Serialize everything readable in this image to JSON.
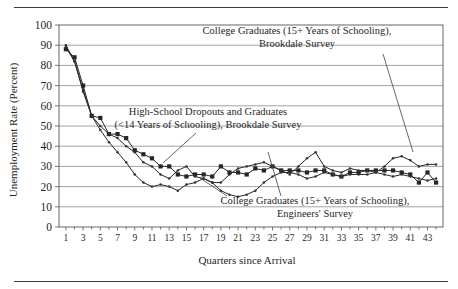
{
  "figure": {
    "top_rule": "rule",
    "bottom_rule": "rule"
  },
  "chart_data": {
    "type": "line",
    "title": "",
    "xlabel": "Quarters since Arrival",
    "ylabel": "Unemployment Rate (Percent)",
    "xlim": [
      0.2,
      44.8
    ],
    "ylim": [
      0,
      100
    ],
    "ytick_values": [
      0,
      10,
      20,
      30,
      40,
      50,
      60,
      70,
      80,
      90,
      100
    ],
    "ytick_labels": [
      "0",
      "10",
      "20",
      "30",
      "40",
      "50",
      "60",
      "70",
      "80",
      "90",
      "100"
    ],
    "xtick_values": [
      1,
      3,
      5,
      7,
      9,
      11,
      13,
      15,
      17,
      19,
      21,
      23,
      25,
      27,
      29,
      31,
      33,
      35,
      37,
      39,
      41,
      43
    ],
    "xtick_labels": [
      "1",
      "3",
      "5",
      "7",
      "9",
      "11",
      "13",
      "15",
      "17",
      "19",
      "21",
      "23",
      "25",
      "27",
      "29",
      "31",
      "33",
      "35",
      "37",
      "39",
      "41",
      "43"
    ],
    "xtick_minor_values": [
      2,
      4,
      6,
      8,
      10,
      12,
      14,
      16,
      18,
      20,
      22,
      24,
      26,
      28,
      30,
      32,
      34,
      36,
      38,
      40,
      42,
      44
    ],
    "grid": "horizontal",
    "legend_position": "annotations-inline",
    "x": [
      1,
      2,
      3,
      4,
      5,
      6,
      7,
      8,
      9,
      10,
      11,
      12,
      13,
      14,
      15,
      16,
      17,
      18,
      19,
      20,
      21,
      22,
      23,
      24,
      25,
      26,
      27,
      28,
      29,
      30,
      31,
      32,
      33,
      34,
      35,
      36,
      37,
      38,
      39,
      40,
      41,
      42,
      43,
      44
    ],
    "series": [
      {
        "name": "College Graduates (15+ Years of Schooling), Brookdale Survey",
        "short_name": "college-brookdale",
        "marker": "filled-square",
        "color": "#262626",
        "values": [
          88,
          84,
          70,
          55,
          54,
          46,
          46,
          44,
          38,
          36,
          34,
          30,
          30,
          26,
          25,
          26,
          26,
          25,
          30,
          27,
          27,
          26,
          29,
          28,
          30,
          28,
          28,
          28,
          27,
          28,
          28,
          26,
          25,
          27,
          27,
          28,
          28,
          28,
          28,
          27,
          26,
          22,
          27,
          22
        ]
      },
      {
        "name": "High-School Dropouts and Graduates (<14 Years of Schooling), Brookdale Survey",
        "short_name": "highschool-brookdale",
        "marker": "small-dot",
        "color": "#333333",
        "values": [
          89,
          82,
          68,
          55,
          50,
          46,
          44,
          40,
          37,
          32,
          30,
          26,
          24,
          28,
          30,
          25,
          24,
          22,
          22,
          26,
          29,
          30,
          31,
          32,
          30,
          28,
          26,
          30,
          34,
          37,
          30,
          28,
          27,
          29,
          28,
          28,
          27,
          30,
          34,
          35,
          33,
          30,
          31,
          31
        ]
      },
      {
        "name": "College Graduates (15+ Years of Schooling), Engineers' Survey",
        "short_name": "college-engineers",
        "marker": "small-dot",
        "color": "#333333",
        "values": [
          90,
          82,
          67,
          55,
          48,
          42,
          37,
          32,
          26,
          22,
          20,
          21,
          20,
          18,
          21,
          22,
          24,
          22,
          18,
          16,
          15,
          16,
          18,
          22,
          25,
          27,
          27,
          26,
          24,
          25,
          27,
          26,
          25,
          26,
          26,
          26,
          27,
          26,
          25,
          26,
          25,
          24,
          23,
          24
        ]
      }
    ],
    "annotations": [
      {
        "id": "annotation-college-brookdale",
        "lines": [
          "College Graduates (15+ Years of Schooling),",
          "Brookdale Survey"
        ]
      },
      {
        "id": "annotation-highschool-brookdale",
        "lines": [
          "High-School Dropouts and Graduates",
          "(<14 Years of Schooling), Brookdale Survey"
        ]
      },
      {
        "id": "annotation-college-engineers",
        "lines": [
          "College Graduates (15+ Years of Schooling),",
          "Engineers' Survey"
        ]
      }
    ]
  }
}
